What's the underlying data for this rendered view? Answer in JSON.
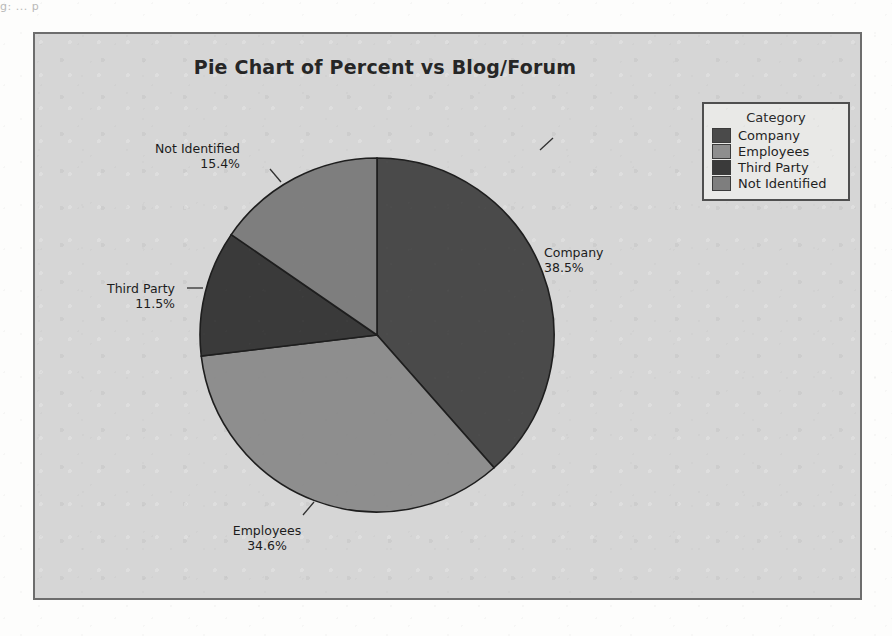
{
  "scan": {
    "fragment_text": "g:  ...   p"
  },
  "chart_data": {
    "type": "pie",
    "title": "Pie Chart of Percent vs Blog/Forum",
    "legend_title": "Category",
    "legend_position": "top-right",
    "start_angle_deg": 0,
    "direction": "clockwise",
    "categories": [
      "Company",
      "Employees",
      "Third Party",
      "Not Identified"
    ],
    "values": [
      38.5,
      34.6,
      11.5,
      15.4
    ],
    "value_unit": "%",
    "labels": [
      {
        "name": "Company",
        "percent": "38.5%",
        "color": "#4a4a4a"
      },
      {
        "name": "Employees",
        "percent": "34.6%",
        "color": "#8e8e8e"
      },
      {
        "name": "Third Party",
        "percent": "11.5%",
        "color": "#3a3a3a"
      },
      {
        "name": "Not Identified",
        "percent": "15.4%",
        "color": "#7e7e7e"
      }
    ],
    "colors": [
      "#4a4a4a",
      "#8e8e8e",
      "#3a3a3a",
      "#7e7e7e"
    ],
    "xlabel": "",
    "ylabel": "",
    "grid": false
  },
  "legend": {
    "title": "Category",
    "items": [
      {
        "label": "Company",
        "color": "#4a4a4a"
      },
      {
        "label": "Employees",
        "color": "#8e8e8e"
      },
      {
        "label": "Third Party",
        "color": "#3a3a3a"
      },
      {
        "label": "Not Identified",
        "color": "#7e7e7e"
      }
    ]
  },
  "annotations": {
    "company": {
      "name": "Company",
      "percent": "38.5%"
    },
    "employees": {
      "name": "Employees",
      "percent": "34.6%"
    },
    "third_party": {
      "name": "Third Party",
      "percent": "11.5%"
    },
    "not_identified": {
      "name": "Not Identified",
      "percent": "15.4%"
    }
  }
}
